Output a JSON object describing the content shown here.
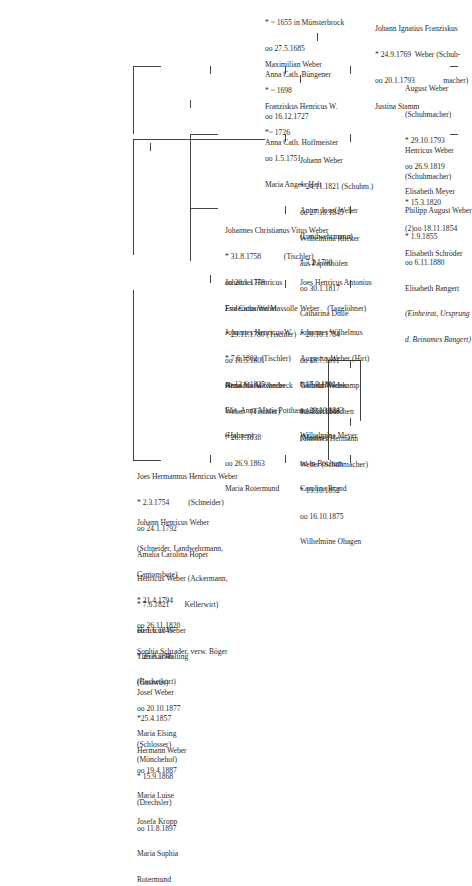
{
  "tree": {
    "root": {
      "lines": [
        "* ~ 1655 in Münsterbrock",
        "oo 27.5.1685",
        "Anna Cath. Büngener"
      ]
    },
    "maximilian": {
      "lines": [
        "Maximilian Weber",
        "* ~ 1698",
        "oo 16.12.1727",
        "Anna Cath. Hoffmeister"
      ]
    },
    "franziskus": {
      "lines": [
        "Franziskus Henricus W.",
        "*~ 1726",
        "oo 1.5.1751",
        "Maria Angela Helt"
      ]
    },
    "joes_hermannus": {
      "lines": [
        "Joes Hermannus Henricus Weber",
        "* 2.3.1754          (Schneider)",
        "oo 24.1.1792",
        "Amalia Carolina Höper"
      ]
    },
    "johannes_christianus": {
      "lines": [
        "Johannes Christianus Vitus Weber",
        "* 31.8.1758            (Tischler)",
        "oo 20.1.1778",
        "Eva Catharina Massolle"
      ]
    },
    "johann_ignatius": {
      "lines": [
        "Johann Ignatius Franziskus",
        "* 24.9.1769  Weber (Schuh-",
        "oo 20.1.1793               macher)",
        "Justina Stamm"
      ]
    },
    "johann_henricus": {
      "lines": [
        "Johann Henricus Weber",
        "(Schneider, Landwehrmann,",
        "Cantonsbote)",
        "* 21.4.1794",
        "oo 26.11.1820",
        "Sophia Schrader, verw. Böger"
      ]
    },
    "johannes_henricus_f": {
      "lines": [
        "Johannes Henricus",
        "Fridericus Weber",
        "* 29.11.1780 (Tischler)",
        "oo 10.5.1801",
        "Anna Maria Oberbeck"
      ]
    },
    "joes_henricus_antonius": {
      "lines": [
        "Joes Henricus Antonius",
        "Weber    (Tagelöhner)",
        "* 20.10.1784",
        "oo 18.7.1811",
        "Gertrud Wedekamp",
        "aus Kirchborchen"
      ]
    },
    "anton_josef": {
      "lines": [
        "Anton Josef Weber",
        "(Landwehrmann)",
        "* 7.2.1790",
        "oo 30.1.1817",
        "Catharina Dolle"
      ]
    },
    "august": {
      "lines": [
        "August Weber",
        "(Schuhmacher)",
        "* 29.10.1793",
        "oo 26.9.1819",
        "Elisabeth Meyer"
      ]
    },
    "henricus_ackermann": {
      "lines": [
        "Henricus Weber (Ackermann,",
        "* 7.6.1821        Kellerwirt)",
        "oo 1.6.1845",
        "Theresia Hölting",
        "(Beckerkort)"
      ]
    },
    "johannes_henricus_w": {
      "lines": [
        "Johannes Henricus W.",
        "* 7.6.1802  (Tischler)",
        "oo 12.6.1825",
        "Elis. Anna Maria Potthast",
        "(Hahnen)"
      ]
    },
    "johannes_wilhelmus": {
      "lines": [
        "Johannes Wilhelmus",
        "Augustus Weber (Hirt)",
        "* 17.9.1811",
        "oo 29.10.1843",
        "Wilhelmina Meyer"
      ]
    },
    "johann_1821": {
      "lines": [
        "Johann Weber",
        "* 24.11.1821 (Schuhm.)",
        "oo 27.10.1845",
        "Wilhelmina Rheker",
        "aus Papenhöfen"
      ]
    },
    "henricus_1820": {
      "lines": [
        "Henricus Weber",
        "(Schuhmacher)",
        "* 15.3.1820",
        "(2)oo 18.11.1854",
        "Elisabeth Schröder"
      ]
    },
    "henricus_gastwirt": {
      "lines": [
        "Henricus Weber",
        "* 25.8.1846",
        "(Gastwirt)",
        "oo 20.10.1877",
        "Maria Elsing",
        "(Mönchehof)"
      ]
    },
    "josef": {
      "lines": [
        "Josef Weber",
        "*25.4.1857",
        "(Schlosser)",
        "oo 19.4.1887",
        "Maria Luise",
        "Josefa Kropp"
      ]
    },
    "hermann": {
      "lines": [
        "Hermann Weber",
        "* 15.9.1868",
        "(Drechsler)",
        "oo 11.8.1897",
        "Maria Sophia",
        "Rotermund"
      ]
    },
    "henricus_alexander": {
      "lines": [
        "Henricus Alexander",
        "Weber   (Tischler)",
        "* 26.1.1838",
        "oo 26.9.1863",
        "Maria Rotermund"
      ]
    },
    "wilhelm": {
      "lines": [
        "Wilhelm Weber",
        "* 16.10.1848",
        "(Maurer)",
        "oo in Bochum",
        "Carolina Brand"
      ]
    },
    "johannes_hermann": {
      "lines": [
        "Johannes Hermann",
        "Weber (Schuhmacher)",
        "* 19.10.1852",
        "oo 16.10.1875",
        "Wilhelmine Ohagen"
      ]
    },
    "philipp": {
      "lines": [
        "Philipp August Weber",
        "* 1.9.1855",
        "oo 6.11.1880",
        "Elisabeth Bangert"
      ],
      "note": [
        "(Einheirat, Ursprung",
        "d. Beinames Bangert)"
      ]
    }
  }
}
